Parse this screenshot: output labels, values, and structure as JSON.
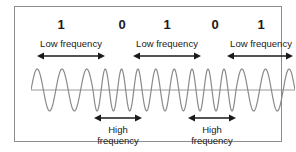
{
  "figure": {
    "border_color": "#8c8c8c",
    "background": "#ffffff",
    "wave_color": "#8a8a8a",
    "baseline_color": "#9a9a9a",
    "arrow_color": "#1a1a1a",
    "text_color": "#1a1a1a"
  },
  "bits": [
    {
      "value": "1",
      "x": 46
    },
    {
      "value": "0",
      "x": 107
    },
    {
      "value": "1",
      "x": 152
    },
    {
      "value": "0",
      "x": 200
    },
    {
      "value": "1",
      "x": 246
    }
  ],
  "low_frequency_bands": [
    {
      "label": "Low frequency",
      "label_x": 56,
      "x1": 22,
      "x2": 90
    },
    {
      "label": "Low frequency",
      "label_x": 152,
      "x1": 118,
      "x2": 186
    },
    {
      "label": "Low frequency",
      "label_x": 246,
      "x1": 212,
      "x2": 278
    }
  ],
  "high_frequency_bands": [
    {
      "label_line1": "High",
      "label_line2": "frequency",
      "label_x": 103,
      "x1": 79,
      "x2": 127
    },
    {
      "label_line1": "High",
      "label_line2": "frequency",
      "label_x": 197,
      "x1": 173,
      "x2": 221
    }
  ],
  "chart_data": {
    "type": "line",
    "xlabel": "",
    "ylabel": "",
    "grid": false,
    "legend": null,
    "bit_sequence": [
      "1",
      "0",
      "1",
      "0",
      "1"
    ],
    "annotations": [
      "Low frequency",
      "High frequency",
      "Low frequency",
      "High frequency",
      "Low frequency"
    ],
    "segments": [
      {
        "bit": "1",
        "frequency": "low",
        "cycles": 2.5,
        "x_start": 0,
        "x_end": 62
      },
      {
        "bit": "0",
        "frequency": "high",
        "cycles": 3,
        "x_start": 62,
        "x_end": 111
      },
      {
        "bit": "1",
        "frequency": "low",
        "cycles": 2.5,
        "x_start": 111,
        "x_end": 157
      },
      {
        "bit": "0",
        "frequency": "high",
        "cycles": 3,
        "x_start": 157,
        "x_end": 205
      },
      {
        "bit": "1",
        "frequency": "low",
        "cycles": 2.5,
        "x_start": 205,
        "x_end": 264
      }
    ],
    "amplitude": 1.0,
    "baseline_y": 0
  }
}
